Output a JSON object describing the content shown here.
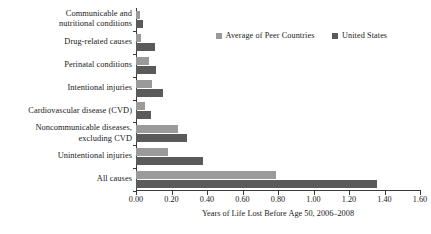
{
  "chart_data": {
    "type": "bar",
    "orientation": "horizontal",
    "title": "",
    "xlabel": "Years of Life Lost Before Age 50, 2006–2008",
    "ylabel": "",
    "xlim": [
      0.0,
      1.6
    ],
    "xticks": [
      0.0,
      0.2,
      0.4,
      0.6,
      0.8,
      1.0,
      1.2,
      1.4,
      1.6
    ],
    "xtick_labels": [
      "0.00",
      "0.20",
      "0.40",
      "0.60",
      "0.80",
      "1.00",
      "1.20",
      "1.40",
      "1.60"
    ],
    "grid": false,
    "legend_position": "top-right",
    "categories": [
      "Communicable and nutritional conditions",
      "Drug-related causes",
      "Perinatal conditions",
      "Intentional injuries",
      "Cardiovascular disease (CVD)",
      "Noncommunicable diseases, excluding CVD",
      "Unintentional injuries",
      "All causes"
    ],
    "category_lines": [
      [
        "Communicable and",
        "nutritional conditions"
      ],
      [
        "Drug-related causes"
      ],
      [
        "Perinatal conditions"
      ],
      [
        "Intentional injuries"
      ],
      [
        "Cardiovascular disease (CVD)"
      ],
      [
        "Noncommunicable diseases,",
        "excluding CVD"
      ],
      [
        "Unintentional injuries"
      ],
      [
        "All causes"
      ]
    ],
    "series": [
      {
        "name": "Average of Peer Countries",
        "color": "#9a9a9a",
        "values": [
          0.025,
          0.03,
          0.075,
          0.09,
          0.05,
          0.235,
          0.18,
          0.79
        ]
      },
      {
        "name": "United States",
        "color": "#5a5a5a",
        "values": [
          0.04,
          0.105,
          0.115,
          0.15,
          0.085,
          0.29,
          0.38,
          1.36
        ]
      }
    ]
  },
  "legend": {
    "entries": [
      {
        "label": "Average of Peer Countries",
        "color": "#9a9a9a"
      },
      {
        "label": "United States",
        "color": "#5a5a5a"
      }
    ]
  },
  "axis": {
    "x_title": "Years of Life Lost Before Age 50, 2006–2008"
  }
}
